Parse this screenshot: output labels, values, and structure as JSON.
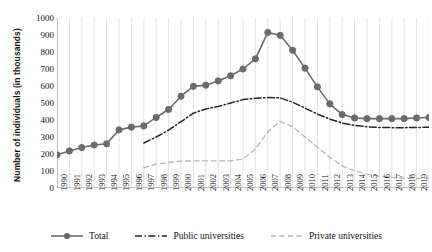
{
  "chart_data": {
    "type": "line",
    "title": "",
    "xlabel": "",
    "ylabel": "Number of individuals (in thousands)",
    "ylim": [
      0,
      1000
    ],
    "ytick_step": 100,
    "grid": "vertical",
    "legend_position": "bottom",
    "categories": [
      "1990",
      "1991",
      "1992",
      "1993",
      "1994",
      "1995",
      "1996",
      "1997",
      "1998",
      "1999",
      "2000",
      "2001",
      "2002",
      "2003",
      "2004",
      "2005",
      "2006",
      "2007",
      "2008",
      "2009",
      "2010",
      "2011",
      "2012",
      "2013",
      "2014",
      "2015",
      "2016",
      "2017",
      "2018",
      "2019",
      "2020"
    ],
    "yticks": [
      "0",
      "100",
      "200",
      "300",
      "400",
      "500",
      "600",
      "700",
      "800",
      "900",
      "1000"
    ],
    "series": [
      {
        "name": "Total",
        "style": "solid-markers",
        "color": "#6b6b6b",
        "values": [
          195,
          218,
          238,
          253,
          260,
          342,
          358,
          365,
          415,
          462,
          540,
          598,
          605,
          630,
          660,
          700,
          760,
          915,
          898,
          810,
          705,
          595,
          495,
          432,
          412,
          408,
          408,
          408,
          408,
          412,
          415
        ]
      },
      {
        "name": "Public universities",
        "style": "dash-dot",
        "color": "#262626",
        "values": [
          null,
          null,
          null,
          null,
          null,
          null,
          null,
          265,
          300,
          340,
          390,
          440,
          465,
          480,
          500,
          520,
          528,
          532,
          530,
          505,
          470,
          435,
          405,
          382,
          368,
          360,
          356,
          355,
          355,
          356,
          358
        ]
      },
      {
        "name": "Private universities",
        "style": "dashed",
        "color": "#b5b5b5",
        "values": [
          null,
          null,
          null,
          null,
          null,
          null,
          null,
          120,
          140,
          150,
          158,
          160,
          160,
          160,
          160,
          170,
          230,
          330,
          392,
          360,
          300,
          240,
          180,
          130,
          100,
          82,
          70,
          62,
          58,
          56,
          58
        ]
      }
    ]
  },
  "legend": {
    "items": [
      {
        "label": "Total",
        "marker": "circle-line",
        "color": "#6b6b6b"
      },
      {
        "label": "Public universities",
        "marker": "dash-dot-line",
        "color": "#262626"
      },
      {
        "label": "Private universities",
        "marker": "dashed-line",
        "color": "#b5b5b5"
      }
    ]
  }
}
